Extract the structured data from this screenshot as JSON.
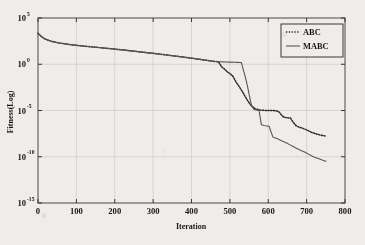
{
  "figure": {
    "background_color": "#efedea",
    "ink_color": "#1a1716",
    "plot_frame_color": "#4a4644",
    "grid_color": "#c9c5c0"
  },
  "chart_data": {
    "type": "line",
    "title": "",
    "xlabel": "Iteration",
    "ylabel": "Fitness(Log)",
    "yscale": "log",
    "xlim": [
      0,
      800
    ],
    "ylim": [
      1e-15,
      100000.0
    ],
    "grid": true,
    "legend_position": "top-right",
    "xticks": [
      0,
      100,
      200,
      300,
      400,
      500,
      600,
      700,
      800
    ],
    "xtick_labels": [
      "0",
      "100",
      "200",
      "300",
      "400",
      "500",
      "600",
      "700",
      "800"
    ],
    "yticks": [
      100000.0,
      1.0,
      1e-05,
      1e-10,
      1e-15
    ],
    "ytick_labels": [
      "10",
      "10",
      "10",
      "10",
      "10"
    ],
    "ytick_exponents": [
      "5",
      "0",
      "-5",
      "-10",
      "-15"
    ],
    "series": [
      {
        "name": "ABC",
        "style": "dotted",
        "color": "#2a2725",
        "x": [
          0,
          10,
          20,
          35,
          55,
          80,
          110,
          145,
          185,
          225,
          265,
          300,
          340,
          375,
          410,
          440,
          460,
          470,
          478,
          486,
          494,
          500,
          508,
          516,
          524,
          532,
          540,
          548,
          556,
          566,
          580,
          596,
          610,
          620,
          628,
          634,
          640,
          646,
          652,
          658,
          664,
          672,
          680,
          690,
          700,
          712,
          724,
          736,
          748
        ],
        "y": [
          2200,
          900,
          500,
          300,
          200,
          140,
          100,
          72,
          50,
          34,
          22,
          15,
          9.5,
          6.2,
          4.0,
          2.6,
          2.0,
          1.9,
          0.55,
          0.3,
          0.14,
          0.1,
          0.05,
          0.012,
          0.004,
          0.0012,
          0.00032,
          9e-05,
          3.2e-05,
          1.5e-05,
          1.1e-05,
          1e-05,
          1e-05,
          9.5e-06,
          7e-06,
          3.5e-06,
          2e-06,
          1.7e-06,
          1.6e-06,
          1.5e-06,
          6e-07,
          2.4e-07,
          1.6e-07,
          1.2e-07,
          8e-08,
          4.5e-08,
          3e-08,
          2.2e-08,
          1.8e-08
        ]
      },
      {
        "name": "MABC",
        "style": "solid",
        "color": "#5a5552",
        "x": [
          0,
          10,
          20,
          35,
          55,
          80,
          110,
          145,
          185,
          225,
          265,
          300,
          340,
          375,
          410,
          440,
          462,
          470,
          476,
          482,
          490,
          500,
          512,
          520,
          526,
          530,
          534,
          538,
          542,
          546,
          550,
          556,
          562,
          566,
          570,
          576,
          582,
          588,
          594,
          602,
          612,
          624,
          636,
          648,
          660,
          672,
          684,
          696,
          708,
          720,
          732,
          744,
          750
        ],
        "y": [
          2200,
          900,
          500,
          300,
          200,
          140,
          100,
          72,
          50,
          34,
          22,
          15,
          9.5,
          6.2,
          4.0,
          2.6,
          2.0,
          1.9,
          1.85,
          1.8,
          1.75,
          1.7,
          1.65,
          1.6,
          1.55,
          1.5,
          0.35,
          0.09,
          0.02,
          0.004,
          0.0006,
          4e-05,
          1.4e-05,
          1.2e-05,
          1.1e-05,
          1e-05,
          3e-07,
          2.4e-07,
          2.2e-07,
          2e-07,
          1.4e-08,
          9e-09,
          5e-09,
          3e-09,
          1.6e-09,
          9e-10,
          5e-10,
          3e-10,
          1.6e-10,
          9e-11,
          6e-11,
          4e-11,
          3.2e-11
        ]
      }
    ],
    "legend": [
      {
        "label": "ABC",
        "style": "dotted"
      },
      {
        "label": "MABC",
        "style": "solid"
      }
    ]
  }
}
